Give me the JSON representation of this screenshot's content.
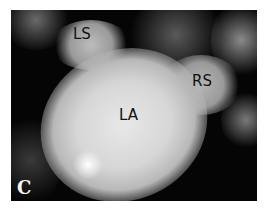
{
  "figure": {
    "panel_letter": "C",
    "labels": {
      "left_structure": "LS",
      "right_structure": "RS",
      "center_structure": "LA"
    },
    "colors": {
      "background": "#050505",
      "tissue_bright": "#e6e6e6",
      "tissue_mid": "#9a9a9a",
      "label_text": "#111111",
      "panel_letter": "#f4f4f4"
    }
  }
}
